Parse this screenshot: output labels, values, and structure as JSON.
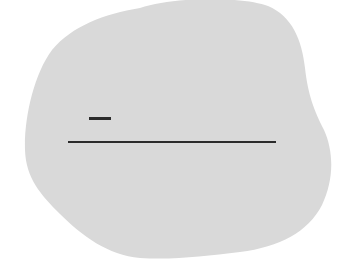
{
  "scene": {
    "background_color": "#ffffff",
    "blob": {
      "shape": "irregular rounded blob",
      "fill_color": "#d9d9d9"
    },
    "marks": [
      {
        "type": "short-dash",
        "color": "#2b2b2b"
      },
      {
        "type": "horizontal-line",
        "color": "#2b2b2b"
      }
    ]
  }
}
